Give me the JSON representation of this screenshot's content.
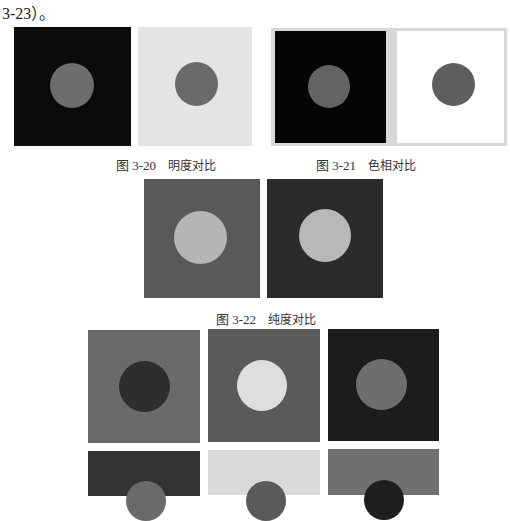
{
  "lead_text": "3-23）。",
  "figures": {
    "fig_3_20": {
      "number": "图 3-20",
      "title": "明度对比"
    },
    "fig_3_21": {
      "number": "图 3-21",
      "title": "色相对比"
    },
    "fig_3_22": {
      "number": "图 3-22",
      "title": "纯度对比"
    }
  },
  "colors": {
    "black_bg": "#0b0b0b",
    "light_bg": "#e4e4e4",
    "white_bg": "#ffffff",
    "mid_gray_circle": "#6d6d6d",
    "frame_gray": "#d6d6d6",
    "purity_bg_1": "#595959",
    "purity_bg_2": "#2b2b2b",
    "purity_circle": "#b5b5b5",
    "grid_a_bg": "#6a6a6a",
    "grid_a_circle": "#2e2e2e",
    "grid_b_bg": "#5a5a5a",
    "grid_b_circle": "#dedede",
    "grid_c_bg": "#1c1c1c",
    "grid_c_circle": "#6e6e6e",
    "grid_d_bg": "#333333",
    "grid_d_circle": "#6a6a6a",
    "grid_e_bg": "#d9d9d9",
    "grid_e_circle": "#5a5a5a",
    "grid_f_bg": "#707070",
    "grid_f_circle": "#1e1e1e"
  }
}
